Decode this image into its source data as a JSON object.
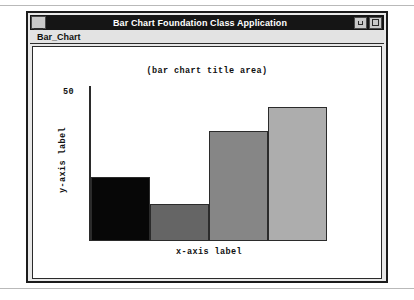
{
  "window": {
    "title": "Bar Chart Foundation Class Application",
    "system_menu_icon": "window-menu-icon",
    "minimize_icon": "minimize-icon",
    "maximize_icon": "maximize-icon"
  },
  "menu_bar": {
    "items": [
      {
        "label": "Bar_Chart"
      }
    ]
  },
  "chart_data": {
    "type": "bar",
    "title": "(bar chart title area)",
    "xlabel": "x-axis label",
    "ylabel": "y-axis label",
    "categories": [
      "",
      "",
      "",
      ""
    ],
    "values": [
      24,
      14,
      41,
      50
    ],
    "ylim": [
      0,
      58
    ],
    "yticks": [
      50
    ],
    "ytick_labels": [
      "50"
    ],
    "grid": false,
    "legend": "none",
    "bar_colors": [
      "#070707",
      "#656565",
      "#868686",
      "#adadad"
    ],
    "bar_edge_color": "#2b2b2b",
    "plot_background": "#ffffff"
  }
}
